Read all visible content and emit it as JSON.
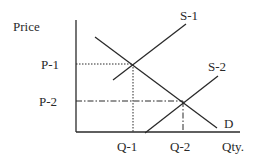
{
  "diagram": {
    "y_axis_label": "Price",
    "x_axis_label": "Qty.",
    "price_levels": [
      {
        "label": "P-1",
        "style": "dotted"
      },
      {
        "label": "P-2",
        "style": "dash-dot"
      }
    ],
    "quantity_levels": [
      {
        "label": "Q-1",
        "style": "dotted"
      },
      {
        "label": "Q-2",
        "style": "dash-dot"
      }
    ],
    "curves": [
      {
        "label": "S-1",
        "type": "supply"
      },
      {
        "label": "S-2",
        "type": "supply"
      },
      {
        "label": "D",
        "type": "demand"
      }
    ],
    "colors": {
      "line": "#2a2a2a",
      "background": "#ffffff"
    }
  }
}
